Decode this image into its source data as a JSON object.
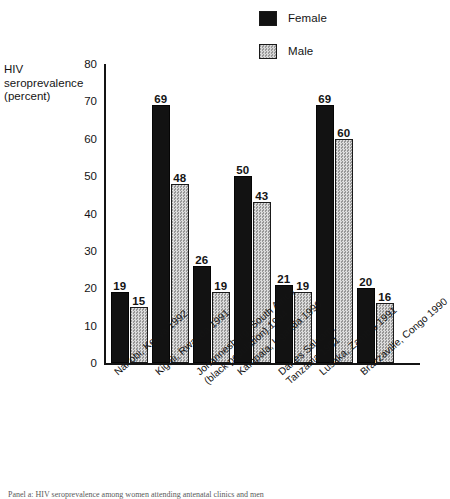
{
  "figure": {
    "y_axis_title": [
      "HIV",
      "seroprevalence",
      "(percent)"
    ],
    "caption": "Panel a: HIV seroprevalence among women attending antenatal clinics and men"
  },
  "legend": {
    "position": "top-center-right",
    "items": [
      {
        "label": "Female",
        "swatch": "solid-black-swatch",
        "color": "#121212"
      },
      {
        "label": "Male",
        "swatch": "dotted-gray-swatch",
        "color": "#b9b9b9"
      }
    ]
  },
  "chart_data": {
    "type": "bar",
    "title": "",
    "subtitle": "",
    "xlabel": "",
    "ylabel": "HIV seroprevalence (percent)",
    "ylim": [
      0,
      80
    ],
    "yticks": [
      0,
      10,
      20,
      30,
      40,
      50,
      60,
      70,
      80
    ],
    "grid": false,
    "legend_position": "top",
    "categories": [
      "Nairobi, Kenya 1992",
      "Kigali, Rwanda 1991",
      "Johannesburg, South Africa\n(black population) 1994",
      "Kampala, Uganda 1990",
      "Dar es Salaam,\nTanzania 1991",
      "Lusaka, Zambia 1991",
      "Brazzaville, Congo 1990"
    ],
    "category_lines": [
      [
        "Nairobi, Kenya 1992"
      ],
      [
        "Kigali, Rwanda 1991"
      ],
      [
        "Johannesburg, South Africa",
        "(black population) 1994"
      ],
      [
        "Kampala, Uganda 1990"
      ],
      [
        "Dar es Salaam,",
        "Tanzania 1991"
      ],
      [
        "Lusaka, Zambia 1991"
      ],
      [
        "Brazzaville, Congo 1990"
      ]
    ],
    "series": [
      {
        "name": "Female",
        "color": "#121212",
        "values": [
          19,
          69,
          26,
          50,
          21,
          69,
          20
        ]
      },
      {
        "name": "Male",
        "color": "#b9b9b9",
        "values": [
          15,
          48,
          19,
          43,
          19,
          60,
          16
        ]
      }
    ]
  }
}
